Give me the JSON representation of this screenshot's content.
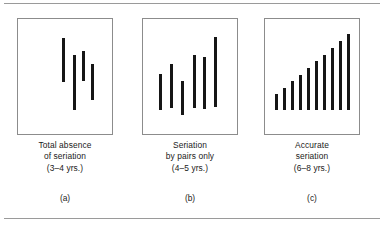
{
  "figure": {
    "background_color": "#ffffff",
    "rule_color": "#9a9a9a",
    "panel_border_color": "#8c8c8c",
    "stick_color": "#161616",
    "top_rule_label": "top-divider-rule",
    "bottom_rule_label": "bottom-divider-rule"
  },
  "panels": [
    {
      "key": "a",
      "label": "(a)",
      "caption_lines": [
        "Total absence",
        "of seriation",
        "(3–4 yrs.)"
      ],
      "caption_line1": "Total absence",
      "caption_line2": "of seriation",
      "caption_line3": "(3–4 yrs.)",
      "age_range": "3–4 yrs.",
      "stage": "Total absence of seriation"
    },
    {
      "key": "b",
      "label": "(b)",
      "caption_lines": [
        "Seriation",
        "by pairs only",
        "(4–5 yrs.)"
      ],
      "caption_line1": "Seriation",
      "caption_line2": "by pairs only",
      "caption_line3": "(4–5 yrs.)",
      "age_range": "4–5 yrs.",
      "stage": "Seriation by pairs only"
    },
    {
      "key": "c",
      "label": "(c)",
      "caption_lines": [
        "Accurate",
        "seriation",
        "(6–8 yrs.)"
      ],
      "caption_line1": "Accurate",
      "caption_line2": "seriation",
      "caption_line3": "(6–8 yrs.)",
      "age_range": "6–8 yrs.",
      "stage": "Accurate seriation"
    }
  ],
  "chart_data": [
    {
      "type": "bar",
      "id": "panel-a-sticks",
      "title": "Total absence of seriation (3–4 yrs.)",
      "xlabel": "",
      "ylabel": "",
      "grid": false,
      "legend": "none",
      "orientation": "vertical",
      "aligned_baseline": false,
      "note": "Sticks of differing lengths placed at differing vertical offsets — no ordering.",
      "categories": [
        "1",
        "2",
        "3",
        "4"
      ],
      "values": [
        44,
        55,
        30,
        36
      ],
      "tops": [
        19,
        36,
        32,
        45
      ],
      "bottoms": [
        63,
        91,
        62,
        81
      ],
      "x_positions": [
        44,
        55,
        64,
        73
      ],
      "ylim": [
        0,
        117
      ],
      "units": "px within panel"
    },
    {
      "type": "bar",
      "id": "panel-b-sticks",
      "title": "Seriation by pairs only (4–5 yrs.)",
      "xlabel": "",
      "ylabel": "",
      "grid": false,
      "legend": "none",
      "orientation": "vertical",
      "aligned_baseline": false,
      "note": "Sticks ordered only within small pairs; overall sequence is not graded.",
      "categories": [
        "1",
        "2",
        "3",
        "4",
        "5",
        "6"
      ],
      "values": [
        36,
        44,
        34,
        53,
        52,
        70
      ],
      "tops": [
        55,
        45,
        62,
        36,
        38,
        18
      ],
      "bottoms": [
        91,
        89,
        96,
        89,
        90,
        88
      ],
      "x_positions": [
        16,
        27,
        38,
        50,
        60,
        71
      ],
      "ylim": [
        0,
        117
      ],
      "units": "px within panel"
    },
    {
      "type": "bar",
      "id": "panel-c-bars",
      "title": "Accurate seriation (6–8 yrs.)",
      "xlabel": "",
      "ylabel": "",
      "grid": false,
      "legend": "none",
      "orientation": "vertical",
      "aligned_baseline": true,
      "note": "Ten sticks on a common baseline increasing monotonically in length — a correct series.",
      "categories": [
        "1",
        "2",
        "3",
        "4",
        "5",
        "6",
        "7",
        "8",
        "9",
        "10"
      ],
      "values": [
        16,
        22,
        29,
        35,
        42,
        49,
        55,
        62,
        69,
        76
      ],
      "baseline": 91,
      "x_positions": [
        10,
        18,
        26,
        34,
        42,
        50,
        58,
        66,
        74,
        82
      ],
      "ylim": [
        0,
        117
      ],
      "units": "px within panel"
    }
  ]
}
